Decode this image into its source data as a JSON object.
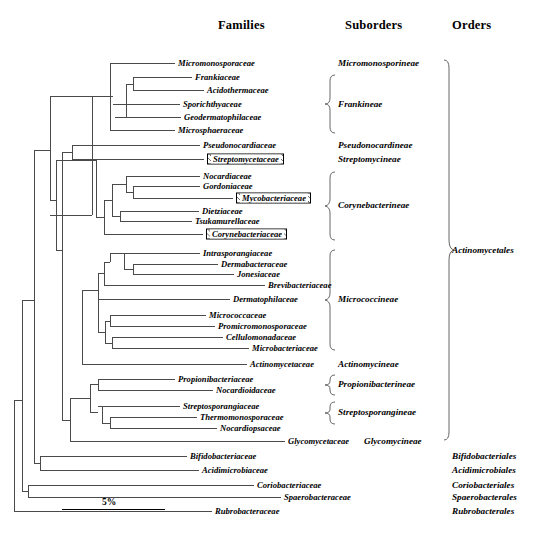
{
  "headers": {
    "families": "Families",
    "suborders": "Suborders",
    "orders": "Orders"
  },
  "scale": {
    "label": "5%"
  },
  "caption": "",
  "families": [
    {
      "name": "Micromonosporaceae",
      "y": 63,
      "x": 178,
      "boxed": false
    },
    {
      "name": "Frankiaceae",
      "y": 77,
      "x": 195,
      "boxed": false
    },
    {
      "name": "Acidothermaceae",
      "y": 90,
      "x": 207,
      "boxed": false
    },
    {
      "name": "Sporichthyaceae",
      "y": 104,
      "x": 183,
      "boxed": false
    },
    {
      "name": "Geodermatophilaceae",
      "y": 117,
      "x": 184,
      "boxed": false
    },
    {
      "name": "Microsphaeraceae",
      "y": 130,
      "x": 178,
      "boxed": false
    },
    {
      "name": "Pseudonocardiaceae",
      "y": 145,
      "x": 203,
      "boxed": false
    },
    {
      "name": "Streptomycetaceae",
      "y": 159,
      "x": 207,
      "boxed": true
    },
    {
      "name": "Nocardiaceae",
      "y": 176,
      "x": 203,
      "boxed": false
    },
    {
      "name": "Gordoniaceae",
      "y": 186,
      "x": 203,
      "boxed": false
    },
    {
      "name": "Mycobacteriaceae",
      "y": 198,
      "x": 236,
      "boxed": true
    },
    {
      "name": "Dietziaceae",
      "y": 211,
      "x": 202,
      "boxed": false
    },
    {
      "name": "Tsukamurellaceae",
      "y": 221,
      "x": 195,
      "boxed": false
    },
    {
      "name": "Corynebacteriaceae",
      "y": 234,
      "x": 206,
      "boxed": true
    },
    {
      "name": "Intrasporangiaceae",
      "y": 253,
      "x": 203,
      "boxed": false
    },
    {
      "name": "Dermabacteraceae",
      "y": 264,
      "x": 221,
      "boxed": false
    },
    {
      "name": "Jonesiaceae",
      "y": 274,
      "x": 237,
      "boxed": false
    },
    {
      "name": "Brevibacteriaceae",
      "y": 285,
      "x": 268,
      "boxed": false
    },
    {
      "name": "Dermatophilaceae",
      "y": 299,
      "x": 233,
      "boxed": false
    },
    {
      "name": "Micrococcaceae",
      "y": 315,
      "x": 209,
      "boxed": false
    },
    {
      "name": "Promicromonosporaceae",
      "y": 326,
      "x": 218,
      "boxed": false
    },
    {
      "name": "Cellulomonadaceae",
      "y": 337,
      "x": 226,
      "boxed": false
    },
    {
      "name": "Microbacteriaceae",
      "y": 348,
      "x": 252,
      "boxed": false
    },
    {
      "name": "Actinomycetaceae",
      "y": 364,
      "x": 250,
      "boxed": false
    },
    {
      "name": "Propionibacteriaceae",
      "y": 379,
      "x": 178,
      "boxed": false
    },
    {
      "name": "Nocardioidaceae",
      "y": 390,
      "x": 216,
      "boxed": false
    },
    {
      "name": "Streptosporangiaceae",
      "y": 406,
      "x": 183,
      "boxed": false
    },
    {
      "name": "Thermomonosporaceae",
      "y": 417,
      "x": 200,
      "boxed": false
    },
    {
      "name": "Nocardiopsaceae",
      "y": 428,
      "x": 220,
      "boxed": false
    },
    {
      "name": "Glycomycetaceae",
      "y": 441,
      "x": 288,
      "boxed": false
    },
    {
      "name": "Bifidobacteriaceae",
      "y": 456,
      "x": 190,
      "boxed": false
    },
    {
      "name": "Acidimicrobiaceae",
      "y": 470,
      "x": 202,
      "boxed": false
    },
    {
      "name": "Coriobacteriaceae",
      "y": 485,
      "x": 257,
      "boxed": false
    },
    {
      "name": "Spaerobacteraceae",
      "y": 497,
      "x": 284,
      "boxed": false
    },
    {
      "name": "Rubrobacteraceae",
      "y": 511,
      "x": 215,
      "boxed": false
    }
  ],
  "suborders": [
    {
      "name": "Micromonosporineae",
      "y": 63,
      "x": 338
    },
    {
      "name": "Frankineae",
      "y": 104,
      "x": 338
    },
    {
      "name": "Pseudonocardineae",
      "y": 145,
      "x": 338
    },
    {
      "name": "Streptomycineae",
      "y": 159,
      "x": 338
    },
    {
      "name": "Corynebacterineae",
      "y": 205,
      "x": 338
    },
    {
      "name": "Micrococcineae",
      "y": 299,
      "x": 338
    },
    {
      "name": "Actinomycineae",
      "y": 364,
      "x": 338
    },
    {
      "name": "Propionibacterineae",
      "y": 384,
      "x": 338
    },
    {
      "name": "Streptosporangineae",
      "y": 412,
      "x": 338
    },
    {
      "name": "Glycomycineae",
      "y": 441,
      "x": 364
    }
  ],
  "orders": [
    {
      "name": "Actinomycetales",
      "y": 250,
      "x": 452
    },
    {
      "name": "Bifidobacteriales",
      "y": 456,
      "x": 452
    },
    {
      "name": "Acidimicrobiales",
      "y": 470,
      "x": 452
    },
    {
      "name": "Coriobacteriales",
      "y": 485,
      "x": 452
    },
    {
      "name": "Spaerobacterales",
      "y": 497,
      "x": 452
    },
    {
      "name": "Rubrobacterales",
      "y": 511,
      "x": 452
    }
  ],
  "tree": {
    "description": "phylogenetic-cladogram",
    "horizontal_branches": [
      [
        110,
        63,
        175
      ],
      [
        133,
        77,
        192
      ],
      [
        145,
        90,
        204
      ],
      [
        113,
        104,
        180
      ],
      [
        115,
        117,
        181
      ],
      [
        110,
        130,
        175
      ],
      [
        72,
        145,
        200
      ],
      [
        72,
        159,
        204
      ],
      [
        126,
        176,
        200
      ],
      [
        133,
        186,
        200
      ],
      [
        143,
        198,
        233
      ],
      [
        131,
        211,
        199
      ],
      [
        120,
        221,
        192
      ],
      [
        104,
        234,
        203
      ],
      [
        110,
        253,
        200
      ],
      [
        133,
        264,
        218
      ],
      [
        147,
        274,
        234
      ],
      [
        104,
        285,
        265
      ],
      [
        98,
        299,
        230
      ],
      [
        110,
        315,
        206
      ],
      [
        110,
        326,
        215
      ],
      [
        112,
        337,
        223
      ],
      [
        112,
        348,
        249
      ],
      [
        82,
        364,
        247
      ],
      [
        98,
        379,
        175
      ],
      [
        98,
        390,
        213
      ],
      [
        98,
        406,
        180
      ],
      [
        110,
        417,
        197
      ],
      [
        110,
        428,
        217
      ],
      [
        70,
        441,
        285
      ],
      [
        40,
        456,
        187
      ],
      [
        40,
        470,
        199
      ],
      [
        28,
        485,
        254
      ],
      [
        28,
        497,
        281
      ],
      [
        18,
        511,
        212
      ]
    ],
    "vertical_branches": [
      [
        110,
        63,
        130
      ],
      [
        133,
        77,
        90
      ],
      [
        126,
        84,
        117
      ],
      [
        120,
        100,
        130
      ],
      [
        115,
        108,
        130
      ],
      [
        72,
        145,
        159
      ],
      [
        126,
        176,
        186
      ],
      [
        131,
        211,
        221
      ],
      [
        104,
        181,
        216
      ],
      [
        98,
        225,
        234
      ],
      [
        133,
        264,
        274
      ],
      [
        110,
        258,
        269
      ],
      [
        104,
        264,
        285
      ],
      [
        98,
        275,
        299
      ],
      [
        110,
        315,
        326
      ],
      [
        112,
        337,
        348
      ],
      [
        110,
        321,
        343
      ],
      [
        98,
        332,
        299
      ],
      [
        82,
        290,
        364
      ],
      [
        98,
        379,
        390
      ],
      [
        98,
        406,
        417
      ],
      [
        110,
        417,
        428
      ],
      [
        70,
        384,
        412
      ],
      [
        62,
        250,
        441
      ],
      [
        40,
        456,
        470
      ],
      [
        28,
        485,
        497
      ],
      [
        18,
        463,
        511
      ]
    ]
  }
}
